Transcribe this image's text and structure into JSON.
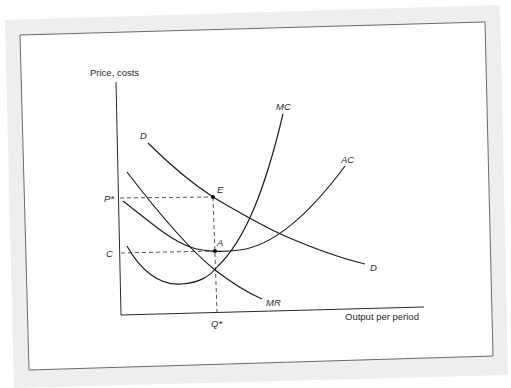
{
  "figure": {
    "y_axis_label": "Price, costs",
    "x_axis_label": "Output per period",
    "curves": [
      {
        "id": "demand",
        "label_start": "D",
        "label_end": "D"
      },
      {
        "id": "marginal-revenue",
        "label": "MR"
      },
      {
        "id": "marginal-cost",
        "label": "MC"
      },
      {
        "id": "average-cost",
        "label": "AC"
      }
    ],
    "points": [
      {
        "id": "E",
        "label": "E",
        "description": "price on demand curve at Q*"
      },
      {
        "id": "A",
        "label": "A",
        "description": "average cost at Q*"
      }
    ],
    "axis_marks": {
      "price": "P*",
      "cost": "C",
      "quantity": "Q*"
    },
    "colors": {
      "line": "#1e1e1e",
      "frame_band": "#eeeeee",
      "frame_border": "#6b6b6b",
      "background": "#ffffff"
    }
  }
}
